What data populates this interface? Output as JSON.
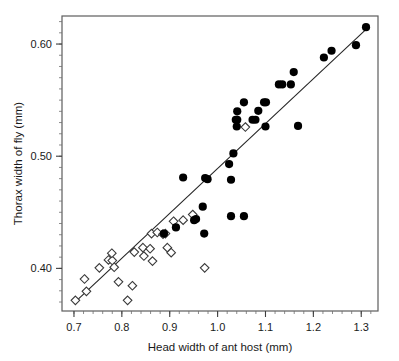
{
  "figure": {
    "background_color": "#ffffff",
    "frame_color": "#5d5d5d"
  },
  "chart_data": {
    "type": "scatter",
    "title": "",
    "xlabel": "Head width of ant host (mm)",
    "ylabel": "Thorax width of fly (mm)",
    "xlim": [
      0.675,
      1.335
    ],
    "ylim": [
      0.362,
      0.625
    ],
    "grid": false,
    "legend_position": "none",
    "x_major_ticks": [
      0.7,
      0.8,
      0.9,
      1.0,
      1.1,
      1.2,
      1.3
    ],
    "x_major_tick_labels": [
      "0.7",
      "0.8",
      "0.9",
      "1.0",
      "1.1",
      "1.2",
      "1.3"
    ],
    "x_minor_tick_step": 0.02,
    "y_major_ticks": [
      0.4,
      0.5,
      0.6
    ],
    "y_major_tick_labels": [
      "0.40",
      "0.50",
      "0.60"
    ],
    "y_minor_tick_step": 0.01,
    "series": [
      {
        "name": "open-diamond-group",
        "marker": "diamond-open",
        "marker_fill": "#ffffff",
        "marker_stroke": "#3a3a3a",
        "points": [
          [
            0.703,
            0.3715
          ],
          [
            0.722,
            0.3905
          ],
          [
            0.726,
            0.3795
          ],
          [
            0.753,
            0.4005
          ],
          [
            0.772,
            0.4075
          ],
          [
            0.78,
            0.407
          ],
          [
            0.779,
            0.4135
          ],
          [
            0.784,
            0.401
          ],
          [
            0.793,
            0.388
          ],
          [
            0.812,
            0.3715
          ],
          [
            0.822,
            0.3845
          ],
          [
            0.826,
            0.4145
          ],
          [
            0.844,
            0.4185
          ],
          [
            0.846,
            0.411
          ],
          [
            0.859,
            0.4175
          ],
          [
            0.862,
            0.431
          ],
          [
            0.864,
            0.4065
          ],
          [
            0.874,
            0.432
          ],
          [
            0.886,
            0.4305
          ],
          [
            0.891,
            0.431
          ],
          [
            0.895,
            0.4185
          ],
          [
            0.903,
            0.414
          ],
          [
            0.908,
            0.442
          ],
          [
            0.928,
            0.443
          ],
          [
            0.948,
            0.448
          ],
          [
            0.973,
            0.4005
          ],
          [
            1.058,
            0.526
          ]
        ]
      },
      {
        "name": "filled-circle-group",
        "marker": "circle-filled",
        "marker_fill": "#000000",
        "points": [
          [
            0.888,
            0.431
          ],
          [
            0.913,
            0.4365
          ],
          [
            0.928,
            0.481
          ],
          [
            0.951,
            0.443
          ],
          [
            0.955,
            0.444
          ],
          [
            0.969,
            0.455
          ],
          [
            0.972,
            0.431
          ],
          [
            0.979,
            0.4795
          ],
          [
            0.974,
            0.4805
          ],
          [
            1.024,
            0.493
          ],
          [
            1.028,
            0.479
          ],
          [
            1.028,
            0.4465
          ],
          [
            1.033,
            0.5025
          ],
          [
            1.038,
            0.5325
          ],
          [
            1.041,
            0.5325
          ],
          [
            1.041,
            0.54
          ],
          [
            1.04,
            0.5265
          ],
          [
            1.055,
            0.548
          ],
          [
            1.055,
            0.4465
          ],
          [
            1.073,
            0.5325
          ],
          [
            1.079,
            0.5325
          ],
          [
            1.085,
            0.5405
          ],
          [
            1.097,
            0.548
          ],
          [
            1.101,
            0.548
          ],
          [
            1.1,
            0.5265
          ],
          [
            1.128,
            0.564
          ],
          [
            1.135,
            0.564
          ],
          [
            1.153,
            0.564
          ],
          [
            1.159,
            0.575
          ],
          [
            1.168,
            0.527
          ],
          [
            1.222,
            0.588
          ],
          [
            1.238,
            0.594
          ],
          [
            1.289,
            0.599
          ],
          [
            1.31,
            0.615
          ]
        ]
      }
    ],
    "fit_line": {
      "name": "regression-line",
      "x_start": 0.7,
      "y_start": 0.369,
      "x_end": 1.315,
      "y_end": 0.615
    }
  }
}
